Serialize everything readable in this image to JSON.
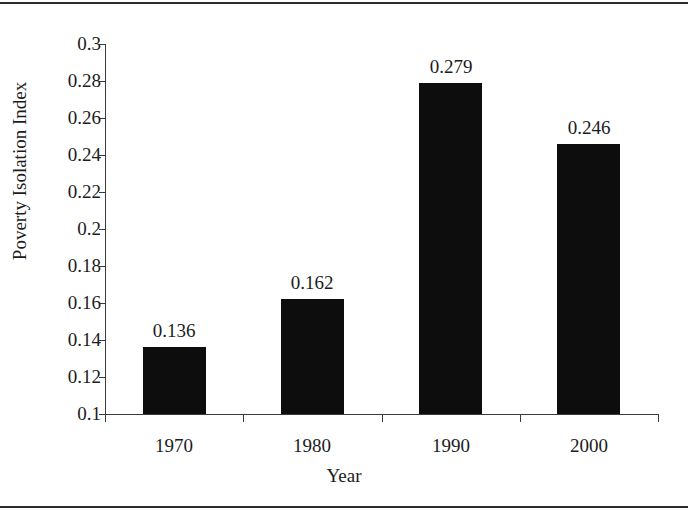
{
  "chart_data": {
    "type": "bar",
    "title": "",
    "xlabel": "Year",
    "ylabel": "Poverty Isolation Index",
    "categories": [
      "1970",
      "1980",
      "1990",
      "2000"
    ],
    "values": [
      0.136,
      0.162,
      0.279,
      0.246
    ],
    "value_labels": [
      "0.136",
      "0.162",
      "0.279",
      "0.246"
    ],
    "ylim": [
      0.1,
      0.3
    ],
    "ytick_values": [
      0.1,
      0.12,
      0.14,
      0.16,
      0.18,
      0.2,
      0.22,
      0.24,
      0.26,
      0.28,
      0.3
    ],
    "ytick_labels": [
      "0.1",
      "0.12",
      "0.14",
      "0.16",
      "0.18",
      "0.2",
      "0.22",
      "0.24",
      "0.26",
      "0.28",
      "0.3"
    ],
    "grid": false,
    "legend": false,
    "legend_position": "none",
    "bar_color": "#0d0d0d",
    "axis_color": "#3a3a3a",
    "text_color": "#1c1c1c",
    "background_color": "#ffffff"
  }
}
